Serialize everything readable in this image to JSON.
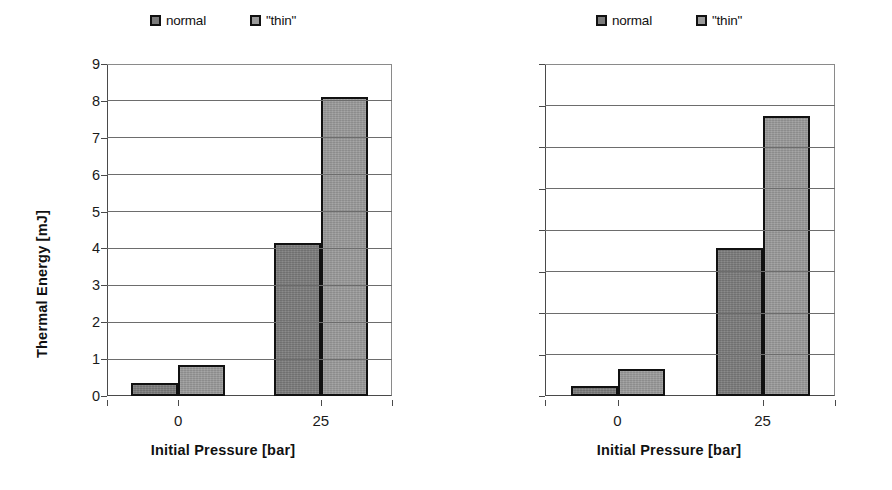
{
  "chart_data": [
    {
      "id": "thermal-energy",
      "type": "bar",
      "title": "",
      "xlabel": "Initial Pressure [bar]",
      "ylabel": "Thermal Energy [mJ]",
      "categories": [
        "0",
        "25"
      ],
      "series": [
        {
          "name": "normal",
          "values": [
            0.35,
            4.15
          ],
          "color": "#7b7b7b"
        },
        {
          "name": "\"thin\"",
          "values": [
            0.85,
            8.1
          ],
          "color": "#9a9a9a"
        }
      ],
      "ylim": [
        0,
        9
      ],
      "ytick_step": 1,
      "ytick_labels": [
        "9",
        "8",
        "7",
        "6",
        "5",
        "4",
        "3",
        "2",
        "1",
        "0"
      ],
      "grid": true,
      "legend_position": "top-center"
    },
    {
      "id": "thermal-efficiency",
      "type": "bar",
      "title": "",
      "xlabel": "Initial Pressure  [bar]",
      "ylabel": "Thermal Efficiency [%]",
      "categories": [
        "0",
        "25"
      ],
      "series": [
        {
          "name": "normal",
          "values": [
            0.5,
            7.15
          ],
          "color": "#7b7b7b"
        },
        {
          "name": "\"thin\"",
          "values": [
            1.3,
            13.5
          ],
          "color": "#9a9a9a"
        }
      ],
      "ylim": [
        0,
        16
      ],
      "ytick_step": 2,
      "ytick_labels": [
        "16",
        "14",
        "12",
        "10",
        "8",
        "6",
        "4",
        "2",
        "0"
      ],
      "grid": true,
      "legend_position": "top-center"
    }
  ],
  "legend": {
    "normal_label": "normal",
    "thin_label": "\"thin\""
  },
  "colors": {
    "normal": "#7b7b7b",
    "thin": "#9a9a9a",
    "axis": "#4a4a4a",
    "grid": "#6d6d6d",
    "background": "#ffffff"
  }
}
